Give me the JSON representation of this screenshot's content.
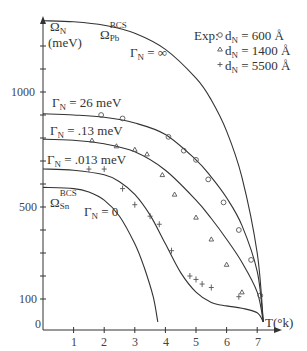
{
  "chart_data": {
    "type": "line",
    "title": "",
    "xlabel": "T(°k)",
    "ylabel": "Ω_N (meV)",
    "xlim": [
      0,
      7.6
    ],
    "ylim": [
      0,
      1350
    ],
    "x_ticks": [
      "1",
      "2",
      "3",
      "4",
      "5",
      "6",
      "7"
    ],
    "y_tick_labels": [
      {
        "value": 1000,
        "label": "1000"
      },
      {
        "value": 500,
        "label": "500"
      },
      {
        "value": 100,
        "label": "100"
      }
    ],
    "y_minor_ticks": [
      100,
      200,
      300,
      400,
      500,
      600,
      700,
      800,
      900,
      1000,
      1100,
      1200
    ],
    "origin_label": "0",
    "grid": false,
    "series": [
      {
        "name": "Ω_Pb^BCS (Γ_N = ∞)",
        "kind": "theory",
        "x": [
          0,
          1,
          2,
          3,
          4,
          5,
          5.5,
          6,
          6.5,
          7.0,
          7.2
        ],
        "y": [
          1310,
          1305,
          1290,
          1255,
          1185,
          1060,
          965,
          830,
          630,
          300,
          0
        ]
      },
      {
        "name": "Γ_N = 26 meV",
        "kind": "theory",
        "x": [
          0,
          1,
          2,
          3,
          4,
          5,
          5.5,
          6,
          6.5,
          7.0,
          7.2
        ],
        "y": [
          905,
          900,
          890,
          865,
          815,
          705,
          630,
          540,
          420,
          220,
          0
        ]
      },
      {
        "name": "Γ_N = .13 meV",
        "kind": "theory",
        "x": [
          0,
          1,
          2,
          3,
          4,
          5,
          5.5,
          6,
          6.5,
          7.0,
          7.2
        ],
        "y": [
          795,
          790,
          775,
          740,
          660,
          530,
          450,
          360,
          260,
          130,
          0
        ]
      },
      {
        "name": "Γ_N = .013 meV",
        "kind": "theory",
        "x": [
          0,
          1,
          2,
          2.5,
          3,
          3.5,
          4,
          4.5,
          5,
          5.5,
          6,
          6.5,
          7.0,
          7.2
        ],
        "y": [
          665,
          660,
          640,
          610,
          555,
          465,
          340,
          215,
          130,
          85,
          70,
          60,
          40,
          0
        ]
      },
      {
        "name": "Ω_Sn^BCS (Γ_N = 0)",
        "kind": "theory",
        "x": [
          0,
          1,
          1.5,
          2,
          2.5,
          3,
          3.3,
          3.6,
          3.75
        ],
        "y": [
          585,
          580,
          565,
          530,
          460,
          340,
          240,
          110,
          0
        ]
      },
      {
        "name": "Exp: d_N = 600 Å",
        "kind": "experiment",
        "marker": "circle",
        "x": [
          1.9,
          2.6,
          4.1,
          4.6,
          5.0,
          5.4,
          5.9,
          6.4,
          6.8,
          7.1
        ],
        "y": [
          900,
          885,
          805,
          745,
          705,
          620,
          520,
          400,
          270,
          115
        ]
      },
      {
        "name": "Exp: d_N = 1400 Å",
        "kind": "experiment",
        "marker": "triangle",
        "x": [
          1.6,
          2.4,
          3.0,
          3.4,
          3.9,
          4.3,
          5.0,
          5.5,
          6.0,
          6.5
        ],
        "y": [
          790,
          765,
          750,
          730,
          640,
          555,
          455,
          360,
          250,
          130
        ]
      },
      {
        "name": "Exp: d_N = 5500 Å",
        "kind": "experiment",
        "marker": "plus",
        "x": [
          1.5,
          2.0,
          2.6,
          3.0,
          3.5,
          3.8,
          4.2,
          4.8,
          5.0,
          5.2,
          5.5,
          6.4
        ],
        "y": [
          665,
          665,
          580,
          510,
          460,
          425,
          310,
          200,
          185,
          165,
          150,
          110
        ]
      }
    ],
    "annotations": [
      {
        "text": "Ω_N",
        "note": "y-axis label line 1"
      },
      {
        "text": "(meV)",
        "note": "y-axis label line 2"
      },
      {
        "text": "Ω_Pb^BCS"
      },
      {
        "text": "Γ_N = ∞"
      },
      {
        "text": "Γ_N = 26 meV"
      },
      {
        "text": "Γ_N = .13 meV"
      },
      {
        "text": "Γ_N = .013 meV"
      },
      {
        "text": "Ω_Sn^BCS"
      },
      {
        "text": "Γ_N = 0"
      }
    ],
    "legend": {
      "position": "top-right",
      "prefix": "Exp:",
      "entries": [
        {
          "marker": "circle",
          "label": "d_N = 600 Å"
        },
        {
          "marker": "triangle",
          "label": "d_N = 1400 Å"
        },
        {
          "marker": "plus",
          "label": "d_N = 5500 Å"
        }
      ]
    }
  },
  "labels": {
    "omega_n": "Ω",
    "omega_n_sub": "N",
    "mev": "(meV)",
    "pb_main": "Ω",
    "pb_sub": "Pb",
    "pb_sup": "BCS",
    "sn_main": "Ω",
    "sn_sub": "Sn",
    "sn_sup": "BCS",
    "gamma": "Γ",
    "gamma_sub": "N",
    "g_inf": " = ∞",
    "g_26": " = 26 meV",
    "g_13": " = .13 meV",
    "g_013": " = .013 meV",
    "g_0": " = 0",
    "xlabel": "T(°k)",
    "origin": "0",
    "legend_prefix": "Exp:",
    "d": "d",
    "d_sub": "N",
    "leg_600": " = 600 Å",
    "leg_1400": " = 1400 Å",
    "leg_5500": " = 5500 Å",
    "y1000": "1000",
    "y500": "500",
    "y100": "100",
    "x1": "1",
    "x2": "2",
    "x3": "3",
    "x4": "4",
    "x5": "5",
    "x6": "6",
    "x7": "7"
  },
  "colors": {
    "ink": "#333333",
    "marker": "#555555"
  }
}
